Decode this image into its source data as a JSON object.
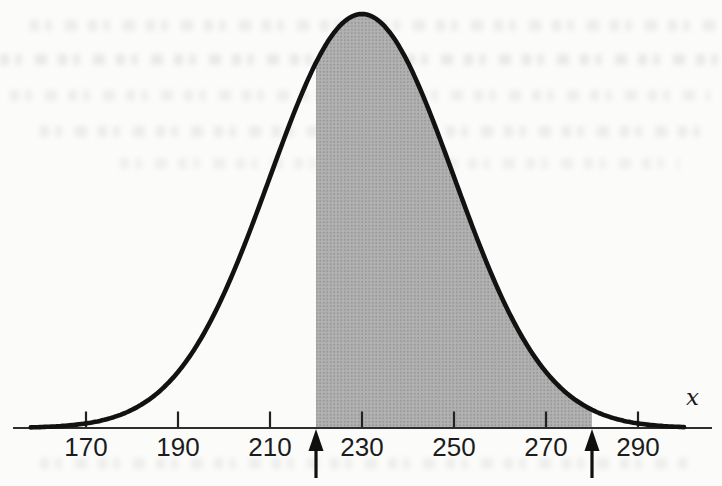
{
  "figure": {
    "kind": "scanned textbook figure",
    "background_color": "#fbfbfa"
  },
  "chart_data": {
    "type": "area",
    "title": "",
    "distribution": {
      "shape": "normal",
      "mean": 230,
      "sd": 20
    },
    "x_ticks": [
      170,
      190,
      210,
      230,
      250,
      270,
      290
    ],
    "xlabel": "x",
    "xlim": [
      154,
      306
    ],
    "curve_draw_range": [
      158,
      300
    ],
    "shaded_region": {
      "from": 220,
      "to": 280
    },
    "arrow_markers_x": [
      220,
      280
    ],
    "grid": false,
    "legend": null,
    "colors": {
      "curve": "#121212",
      "shade_base": "#b2b2b2",
      "shade_dot": "#979797",
      "axis": "#2e2e2e",
      "tick": "#222222",
      "tick_label": "#1c1c1c",
      "arrow": "#101010"
    }
  }
}
